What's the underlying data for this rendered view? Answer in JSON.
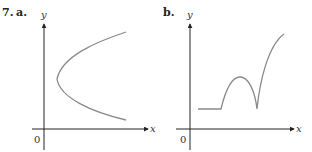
{
  "problem_number": "7.",
  "panels": [
    {
      "label": "a.",
      "x_axis_label": "x",
      "y_axis_label": "y",
      "origin_label": "0",
      "curve_description": "sideways parabola opening to the right"
    },
    {
      "label": "b.",
      "x_axis_label": "x",
      "y_axis_label": "y",
      "origin_label": "0",
      "curve_description": "flat segment, then a rounded hump down to a cusp, then a steep concave-down rise"
    }
  ],
  "colors": {
    "axis": "#222222",
    "curve": "#8a8a8a",
    "text": "#222222"
  }
}
